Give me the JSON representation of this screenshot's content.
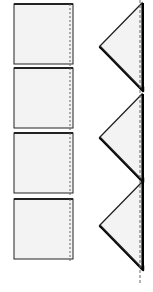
{
  "diagram": {
    "colors": {
      "paper_fill": "#f3f3f3",
      "outline": "#222222",
      "shadow": "#000000",
      "fold_line": "#666666",
      "background": "#ffffff"
    },
    "squares": [
      {
        "step": 1,
        "name": "square-napkin-1"
      },
      {
        "step": 2,
        "name": "square-napkin-2"
      },
      {
        "step": 3,
        "name": "square-napkin-3"
      },
      {
        "step": 4,
        "name": "square-napkin-4"
      }
    ],
    "triangles": [
      {
        "step": 1,
        "name": "folded-triangle-1"
      },
      {
        "step": 2,
        "name": "folded-triangle-2"
      },
      {
        "step": 3,
        "name": "folded-triangle-3"
      }
    ]
  }
}
